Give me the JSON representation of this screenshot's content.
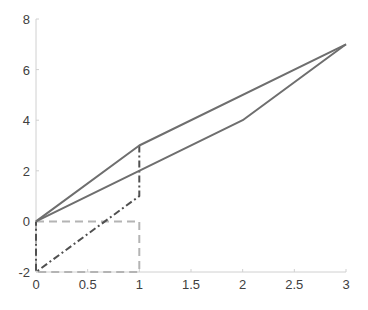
{
  "chart_data": {
    "type": "line",
    "title": "",
    "xlabel": "",
    "ylabel": "",
    "xlim": [
      0,
      3
    ],
    "ylim": [
      -2,
      8
    ],
    "grid": false,
    "legend": null,
    "x_ticks": [
      "0",
      "0.5",
      "1",
      "1.5",
      "2",
      "2.5",
      "3"
    ],
    "y_ticks": [
      "-2",
      "0",
      "2",
      "4",
      "6",
      "8"
    ],
    "series": [
      {
        "name": "solid-upper",
        "style": "solid",
        "color": "#6e6e6e",
        "points": [
          [
            0,
            0
          ],
          [
            1,
            3
          ],
          [
            3,
            7
          ]
        ]
      },
      {
        "name": "solid-lower",
        "style": "solid",
        "color": "#6e6e6e",
        "points": [
          [
            0,
            0
          ],
          [
            2,
            4
          ],
          [
            3,
            7
          ]
        ]
      },
      {
        "name": "dashdot-path",
        "style": "dashdot",
        "color": "#505050",
        "points": [
          [
            1,
            3
          ],
          [
            1,
            1
          ],
          [
            0,
            -2
          ],
          [
            0,
            0
          ]
        ]
      },
      {
        "name": "dashed-box",
        "style": "dashed",
        "color": "#b4b4b4",
        "points": [
          [
            0,
            0
          ],
          [
            1,
            0
          ],
          [
            1,
            -2
          ],
          [
            0,
            -2
          ],
          [
            0,
            0
          ]
        ]
      }
    ]
  },
  "axes": {
    "x_ticks": [
      {
        "v": 0,
        "label": "0"
      },
      {
        "v": 0.5,
        "label": "0.5"
      },
      {
        "v": 1,
        "label": "1"
      },
      {
        "v": 1.5,
        "label": "1.5"
      },
      {
        "v": 2,
        "label": "2"
      },
      {
        "v": 2.5,
        "label": "2.5"
      },
      {
        "v": 3,
        "label": "3"
      }
    ],
    "y_ticks": [
      {
        "v": -2,
        "label": "-2"
      },
      {
        "v": 0,
        "label": "0"
      },
      {
        "v": 2,
        "label": "2"
      },
      {
        "v": 4,
        "label": "4"
      },
      {
        "v": 6,
        "label": "6"
      },
      {
        "v": 8,
        "label": "8"
      }
    ]
  }
}
